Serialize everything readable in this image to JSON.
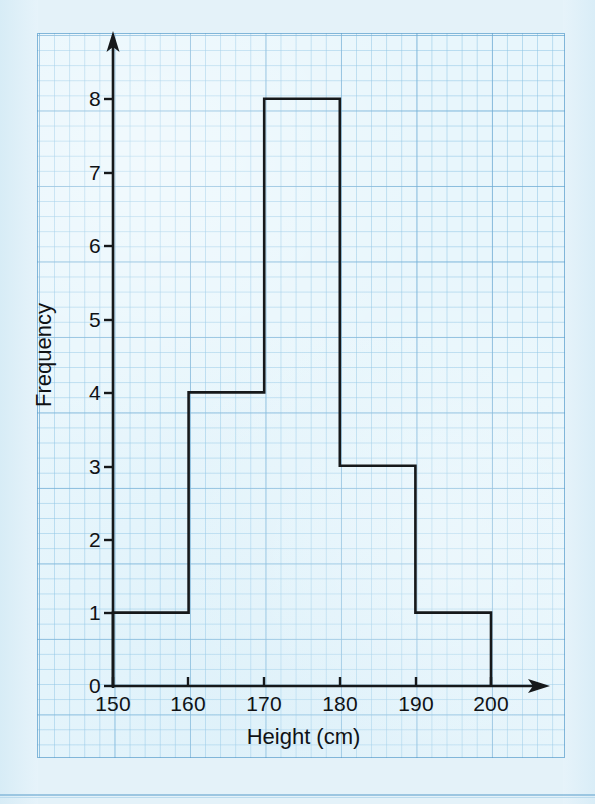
{
  "chart_data": {
    "type": "bar",
    "title": "",
    "xlabel": "Height (cm)",
    "ylabel": "Frequency",
    "bin_width": 10,
    "bin_edges": [
      150,
      160,
      170,
      180,
      190,
      200
    ],
    "categories": [
      "150-160",
      "160-170",
      "170-180",
      "180-190",
      "190-200"
    ],
    "values": [
      1,
      4,
      8,
      3,
      1
    ],
    "xlim": [
      150,
      200
    ],
    "ylim": [
      0,
      8
    ],
    "xticks": [
      150,
      160,
      170,
      180,
      190,
      200
    ],
    "yticks": [
      0,
      1,
      2,
      3,
      4,
      5,
      6,
      7,
      8
    ],
    "xtick_labels": [
      "150",
      "160",
      "170",
      "180",
      "190",
      "200"
    ],
    "ytick_labels": [
      "0",
      "1",
      "2",
      "3",
      "4",
      "5",
      "6",
      "7",
      "8"
    ],
    "grid": true,
    "grid_style": "graph-paper",
    "legend": false,
    "bars": [
      {
        "label": "150-160",
        "x_start": 150,
        "x_end": 160,
        "frequency": 1
      },
      {
        "label": "160-170",
        "x_start": 160,
        "x_end": 170,
        "frequency": 4
      },
      {
        "label": "170-180",
        "x_start": 170,
        "x_end": 180,
        "frequency": 8
      },
      {
        "label": "180-190",
        "x_start": 180,
        "x_end": 190,
        "frequency": 3
      },
      {
        "label": "190-200",
        "x_start": 190,
        "x_end": 200,
        "frequency": 1
      }
    ]
  },
  "axes": {
    "x_title": "Height (cm)",
    "y_title": "Frequency",
    "x_labels": [
      "150",
      "160",
      "170",
      "180",
      "190",
      "200"
    ],
    "y_labels": [
      "0",
      "1",
      "2",
      "3",
      "4",
      "5",
      "6",
      "7",
      "8"
    ],
    "x_arrow_icon": "arrow-right-icon",
    "y_arrow_icon": "arrow-up-icon"
  },
  "colors": {
    "paper": "#e8f6fc",
    "grid_minor": "#8cc3e4",
    "grid_major": "#6eaad2",
    "ink": "#16181a",
    "page_background": "#e4f2f9"
  }
}
